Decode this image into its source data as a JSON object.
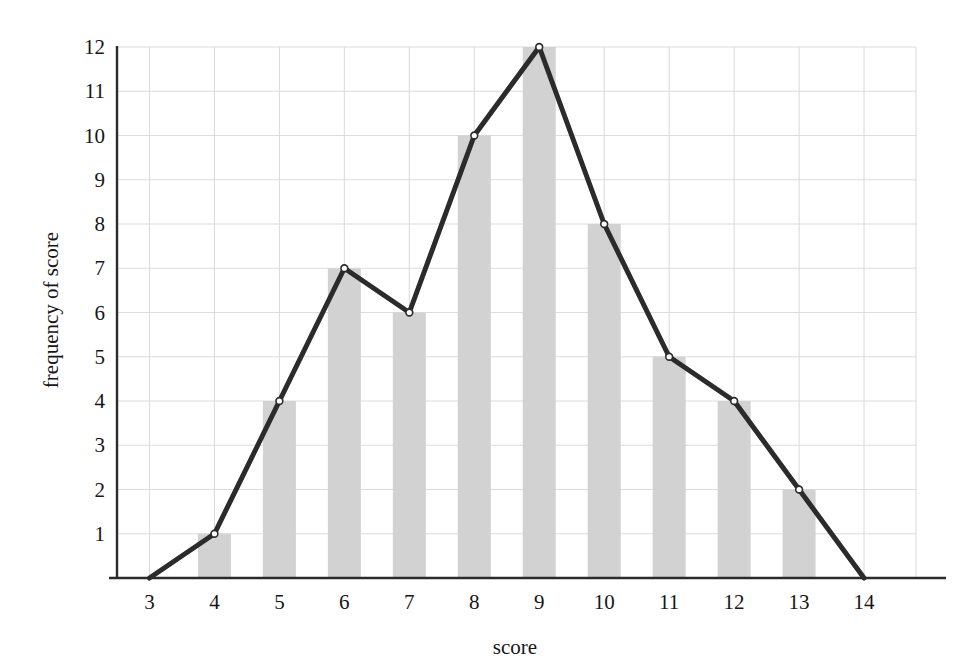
{
  "chart_data": {
    "type": "bar",
    "title": "",
    "subtitle": "",
    "xlabel": "score",
    "ylabel": "frequency of score",
    "categories": [
      3,
      4,
      5,
      6,
      7,
      8,
      9,
      10,
      11,
      12,
      13,
      14
    ],
    "x_tick_labels": [
      "3",
      "4",
      "5",
      "6",
      "7",
      "8",
      "9",
      "10",
      "11",
      "12",
      "13",
      "14"
    ],
    "y_tick_labels": [
      "1",
      "2",
      "3",
      "4",
      "5",
      "6",
      "7",
      "8",
      "9",
      "10",
      "11",
      "12"
    ],
    "y_ticks": [
      1,
      2,
      3,
      4,
      5,
      6,
      7,
      8,
      9,
      10,
      11,
      12
    ],
    "xlim": [
      2.5,
      14.8
    ],
    "ylim": [
      0,
      12
    ],
    "grid": true,
    "legend": "none",
    "series": [
      {
        "name": "histogram bars",
        "type": "bar",
        "values": [
          0,
          1,
          4,
          7,
          6,
          10,
          12,
          8,
          5,
          4,
          2,
          0
        ]
      },
      {
        "name": "frequency polygon",
        "type": "line",
        "values": [
          0,
          1,
          4,
          7,
          6,
          10,
          12,
          8,
          5,
          4,
          2,
          0
        ],
        "markers": "open-circle"
      }
    ],
    "colors": {
      "bar_fill": "#d2d2d2",
      "line": "#2b2b2b",
      "marker_fill": "#ffffff",
      "marker_stroke": "#2b2b2b",
      "grid": "#dcdcdc",
      "axis": "#2b2b2b",
      "text": "#161616",
      "background": "#ffffff"
    }
  }
}
